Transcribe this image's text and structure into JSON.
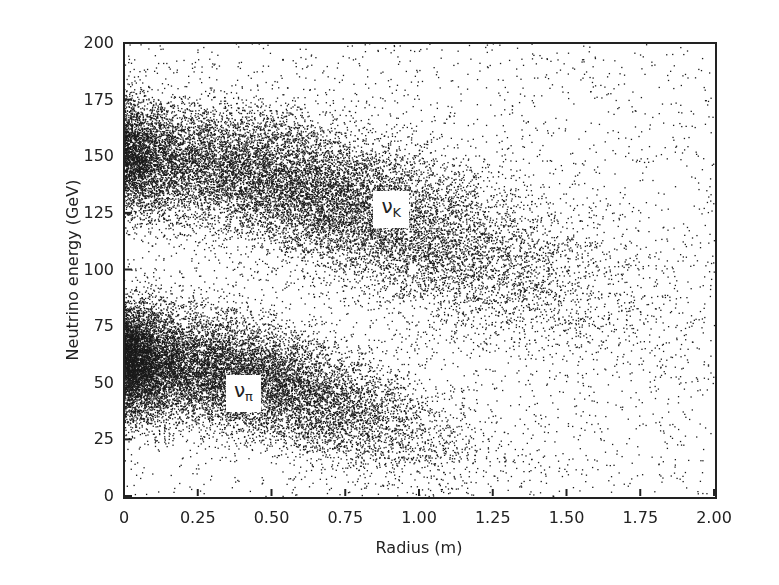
{
  "chart_data": {
    "type": "scatter",
    "title": "",
    "xlabel": "Radius (m)",
    "ylabel": "Neutrino energy (GeV)",
    "xlim": [
      0,
      2.0
    ],
    "ylim": [
      0,
      200
    ],
    "x_ticks": [
      "0",
      "0.25",
      "0.50",
      "0.75",
      "1.00",
      "1.25",
      "1.50",
      "1.75",
      "2.00"
    ],
    "y_ticks": [
      "0",
      "25",
      "50",
      "75",
      "100",
      "125",
      "150",
      "175",
      "200"
    ],
    "grid": false,
    "legend": "none (inline labels)",
    "series": [
      {
        "name": "ν_K",
        "label_main": "ν",
        "label_sub": "K",
        "label_position": {
          "x": 0.92,
          "y": 128
        },
        "description": "Kaon-decay neutrino band, energy falling from ~150 GeV at r≈0.1 m to ~80 GeV at r≈1.9 m",
        "centerline": [
          [
            0.0,
            150
          ],
          [
            0.25,
            147
          ],
          [
            0.5,
            140
          ],
          [
            0.75,
            130
          ],
          [
            1.0,
            118
          ],
          [
            1.25,
            105
          ],
          [
            1.5,
            95
          ],
          [
            1.75,
            85
          ],
          [
            2.0,
            78
          ]
        ],
        "energy_spread": 16,
        "density_peak_x": 0.6,
        "n_points": 16000
      },
      {
        "name": "ν_π",
        "label_main": "ν",
        "label_sub": "π",
        "label_position": {
          "x": 0.42,
          "y": 47
        },
        "description": "Pion-decay neutrino cluster, energy falling from ~60 GeV at r≈0 to ~15 GeV at r≈1.25 m",
        "centerline": [
          [
            0.0,
            60
          ],
          [
            0.25,
            57
          ],
          [
            0.5,
            50
          ],
          [
            0.75,
            40
          ],
          [
            1.0,
            28
          ],
          [
            1.25,
            17
          ],
          [
            1.5,
            12
          ]
        ],
        "energy_spread": 13,
        "density_peak_x": 0.3,
        "n_points": 14000
      },
      {
        "name": "background",
        "description": "Sparse uniform scatter of points over the full plot area",
        "n_points": 2600
      }
    ]
  },
  "render": {
    "seed": 12345,
    "point_color": "#1a1a1a",
    "plot_box": {
      "left": 124,
      "top": 43,
      "right": 714,
      "bottom": 496
    }
  }
}
